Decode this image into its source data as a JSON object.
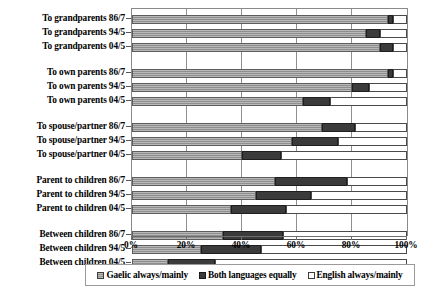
{
  "chart_data": {
    "type": "bar",
    "orientation": "horizontal",
    "stacked": true,
    "stacked_percent": true,
    "title": "",
    "xlabel": "",
    "ylabel": "",
    "xlim": [
      0,
      100
    ],
    "xticks": [
      "0%",
      "20%",
      "40%",
      "60%",
      "80%",
      "100%"
    ],
    "xtick_values": [
      0,
      20,
      40,
      60,
      80,
      100
    ],
    "grid": "vertical",
    "legend_position": "bottom",
    "series": [
      {
        "name": "Gaelic always/mainly",
        "swatch": "gaelic",
        "values": [
          93,
          85,
          90,
          93,
          80,
          62,
          69,
          58,
          40,
          52,
          45,
          36,
          33,
          25,
          13
        ]
      },
      {
        "name": "Both languages equally",
        "swatch": "both",
        "values": [
          2,
          5,
          5,
          2,
          6,
          10,
          12,
          17,
          14,
          26,
          20,
          20,
          22,
          22,
          17
        ]
      },
      {
        "name": "English always/mainly",
        "swatch": "english",
        "values": [
          5,
          10,
          5,
          5,
          14,
          28,
          19,
          25,
          46,
          22,
          35,
          44,
          45,
          53,
          70
        ]
      }
    ],
    "categories": [
      "To grandparents 86/7",
      "To grandparents 94/5",
      "To grandparents 04/5",
      "To own parents 86/7",
      "To own parents 94/5",
      "To own parents 04/5",
      "To spouse/partner 86/7",
      "To spouse/partner 94/5",
      "To spouse/partner 04/5",
      "Parent to children 86/7",
      "Parent to children 94/5",
      "Parent to children 04/5",
      "Between children 86/7",
      "Between children 94/5",
      "Between children 04/5"
    ],
    "category_groups": [
      {
        "label": "To grandparents",
        "count": 3
      },
      {
        "label": "To own parents",
        "count": 3
      },
      {
        "label": "To spouse/partner",
        "count": 3
      },
      {
        "label": "Parent to children",
        "count": 3
      },
      {
        "label": "Between children",
        "count": 3
      }
    ]
  },
  "legend": {
    "items": [
      {
        "label": "Gaelic always/mainly",
        "swatch": "gaelic"
      },
      {
        "label": "Both languages equally",
        "swatch": "both"
      },
      {
        "label": "English always/mainly",
        "swatch": "english"
      }
    ]
  },
  "colors": {
    "gaelic": "#8e8e8e",
    "both": "#3b3b3b",
    "english": "#ffffff",
    "axis": "#6d6d6d",
    "grid": "#8f8f8f",
    "text": "#000000"
  }
}
